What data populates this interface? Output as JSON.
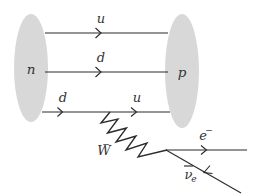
{
  "diagram": {
    "type": "feynman-diagram",
    "colors": {
      "blob_fill": "#d8d8d8",
      "line": "#2b2b2b",
      "label": "#333333",
      "background": "#ffffff"
    },
    "blobs": [
      {
        "id": "neutron",
        "label": "n",
        "cx": 31,
        "cy": 68,
        "rx": 17,
        "ry": 54
      },
      {
        "id": "proton",
        "label": "p",
        "cx": 182,
        "cy": 71,
        "rx": 17,
        "ry": 57
      }
    ],
    "quark_lines": [
      {
        "id": "quark-u-top",
        "label": "u",
        "label_x": 101,
        "label_y": 20,
        "y": 33,
        "x1": 45,
        "x2": 167,
        "arrow_x": 100
      },
      {
        "id": "quark-d-middle",
        "label": "d",
        "label_x": 101,
        "label_y": 59,
        "y": 72,
        "x1": 45,
        "x2": 167,
        "arrow_x": 100
      },
      {
        "id": "quark-d-in",
        "label": "d",
        "label_x": 63,
        "label_y": 99,
        "y": 112,
        "x1": 42,
        "x2": 110,
        "arrow_x": 62
      },
      {
        "id": "quark-u-out",
        "label": "u",
        "label_x": 137,
        "label_y": 99,
        "y": 112,
        "x1": 110,
        "x2": 170,
        "arrow_x": 136
      }
    ],
    "boson": {
      "id": "w-boson",
      "label": "W",
      "superscript": "−",
      "label_x": 110,
      "label_y": 150,
      "start_x": 110,
      "start_y": 112,
      "end_x": 167,
      "end_y": 150,
      "peaks": 5
    },
    "leptons": [
      {
        "id": "electron",
        "label": "e",
        "superscript": "−",
        "label_x": 206,
        "label_y": 137,
        "x1": 167,
        "y1": 150,
        "x2": 246,
        "y2": 150,
        "arrow_x": 206,
        "arrow_dir": "forward"
      },
      {
        "id": "antineutrino",
        "label": "ν",
        "label_overline": true,
        "subscript": "e",
        "label_x": 190,
        "label_y": 178,
        "x1": 167,
        "y1": 150,
        "x2": 240,
        "y2": 192,
        "arrow_t": 0.52,
        "arrow_dir": "backward"
      }
    ],
    "vertex": {
      "x": 167,
      "y": 150
    }
  }
}
